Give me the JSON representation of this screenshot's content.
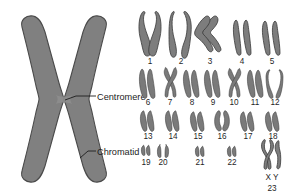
{
  "figure": {
    "background_color": "#ffffff",
    "chromosome_fill": "#7d7d7d",
    "chromosome_stroke": "#3a3a3a"
  },
  "diagram": {
    "name": "single-chromosome-diagram",
    "labels": [
      {
        "id": "centromere",
        "text": "Centromere"
      },
      {
        "id": "chromatid",
        "text": "Chromatid"
      }
    ]
  },
  "karyotype": {
    "name": "human-karyotype",
    "rows": [
      {
        "row": 1,
        "pairs": [
          {
            "number": "1",
            "shape": "metacentric-long"
          },
          {
            "number": "2",
            "shape": "submetacentric-open"
          },
          {
            "number": "3",
            "shape": "bent-chevron"
          },
          {
            "number": "4",
            "shape": "straight-parallel"
          },
          {
            "number": "5",
            "shape": "straight-parallel"
          }
        ]
      },
      {
        "row": 2,
        "pairs": [
          {
            "number": "6",
            "shape": "submetacentric"
          },
          {
            "number": "7",
            "shape": "crossed-x"
          },
          {
            "number": "8",
            "shape": "submetacentric"
          },
          {
            "number": "9",
            "shape": "submetacentric"
          },
          {
            "number": "10",
            "shape": "crossed-x"
          },
          {
            "number": "11",
            "shape": "submetacentric"
          },
          {
            "number": "12",
            "shape": "open-curved"
          }
        ]
      },
      {
        "row": 3,
        "pairs": [
          {
            "number": "13",
            "shape": "acrocentric"
          },
          {
            "number": "14",
            "shape": "acrocentric"
          },
          {
            "number": "15",
            "shape": "acrocentric"
          },
          {
            "number": "16",
            "shape": "acrocentric-curved"
          },
          {
            "number": "17",
            "shape": "acrocentric"
          },
          {
            "number": "18",
            "shape": "acrocentric"
          }
        ]
      },
      {
        "row": 4,
        "pairs": [
          {
            "number": "19",
            "shape": "short-stubby"
          },
          {
            "number": "20",
            "shape": "short-stubby"
          },
          {
            "number": "21",
            "shape": "very-short"
          },
          {
            "number": "22",
            "shape": "very-short"
          }
        ]
      }
    ],
    "sex_pair": {
      "label": "X Y",
      "number": "23",
      "shape": "x-and-y"
    }
  }
}
